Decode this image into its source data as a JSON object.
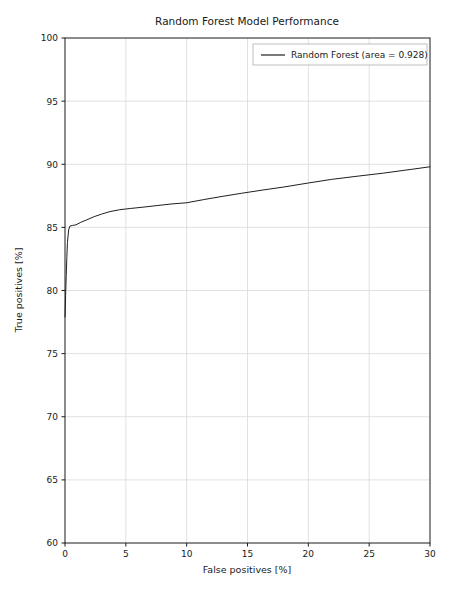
{
  "chart_data": {
    "type": "line",
    "title": "Random Forest Model Performance",
    "xlabel": "False positives [%]",
    "ylabel": "True positives [%]",
    "xlim": [
      0,
      30
    ],
    "ylim": [
      60,
      100
    ],
    "grid": true,
    "legend_position": "upper right",
    "xticks": [
      0,
      5,
      10,
      15,
      20,
      25,
      30
    ],
    "xtick_labels": [
      "0",
      "5",
      "10",
      "15",
      "20",
      "25",
      "30"
    ],
    "yticks": [
      60,
      65,
      70,
      75,
      80,
      85,
      90,
      95,
      100
    ],
    "ytick_labels": [
      "60",
      "65",
      "70",
      "75",
      "80",
      "85",
      "90",
      "95",
      "100"
    ],
    "series": [
      {
        "name": "Random Forest (area = 0.928)",
        "color": "#1f1f1f",
        "linewidth": 1.0,
        "area": 0.928,
        "x": [
          0.0,
          0.05,
          0.1,
          0.15,
          0.2,
          0.3,
          0.4,
          0.6,
          0.9,
          1.3,
          1.8,
          2.4,
          3.0,
          3.7,
          4.5,
          5.4,
          6.4,
          7.5,
          8.7,
          10.0,
          11.4,
          12.9,
          14.5,
          16.2,
          18.0,
          19.9,
          21.9,
          24.0,
          26.2,
          28.5,
          30.0
        ],
        "y": [
          77.9,
          79.6,
          81.2,
          82.6,
          83.8,
          84.8,
          85.1,
          85.15,
          85.2,
          85.4,
          85.6,
          85.85,
          86.05,
          86.25,
          86.4,
          86.5,
          86.6,
          86.72,
          86.85,
          86.95,
          87.2,
          87.45,
          87.7,
          87.95,
          88.2,
          88.5,
          88.8,
          89.05,
          89.3,
          89.6,
          89.8
        ]
      }
    ]
  },
  "legend": {
    "entries": [
      {
        "label": "Random Forest (area = 0.928)",
        "color": "#1f1f1f"
      }
    ]
  }
}
